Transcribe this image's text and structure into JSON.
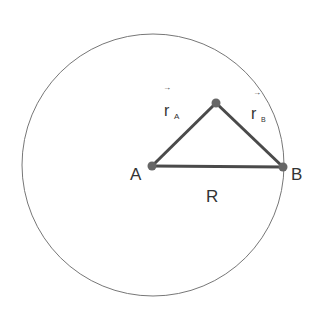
{
  "diagram": {
    "labels": {
      "A": "A",
      "B": "B",
      "R": "R",
      "rA_main": "r",
      "rA_sub": "A",
      "rB_main": "r",
      "rB_sub": "B",
      "arrow": "→"
    },
    "colors": {
      "stroke": "#555555",
      "line": "#4a4a4a",
      "point": "#666666"
    }
  }
}
